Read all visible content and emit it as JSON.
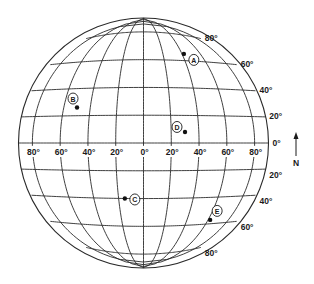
{
  "diagram": {
    "type": "globe-grid",
    "center": [
      143.5,
      143
    ],
    "radius": 125,
    "meridian_labels": [
      "80°",
      "60°",
      "40°",
      "20°",
      "0°",
      "20°",
      "40°",
      "60°",
      "80°"
    ],
    "meridian_degrees": [
      -80,
      -60,
      -40,
      -20,
      0,
      20,
      40,
      60,
      80
    ],
    "north_latitude_labels": [
      "80°",
      "60°",
      "40°",
      "20°"
    ],
    "equator_label": "0°",
    "south_latitude_labels": [
      "20°",
      "40°",
      "60°",
      "80°"
    ],
    "compass": {
      "arrow": "north-arrow",
      "label": "N"
    },
    "points": [
      {
        "id": "A",
        "label": "A",
        "lon": 42,
        "lat": 65
      },
      {
        "id": "B",
        "label": "B",
        "lon": -50,
        "lat": 26
      },
      {
        "id": "C",
        "label": "C",
        "lon": -15,
        "lat": -40
      },
      {
        "id": "D",
        "label": "D",
        "lon": 30,
        "lat": 8
      },
      {
        "id": "E",
        "label": "E",
        "lon": 62,
        "lat": -57
      }
    ]
  }
}
